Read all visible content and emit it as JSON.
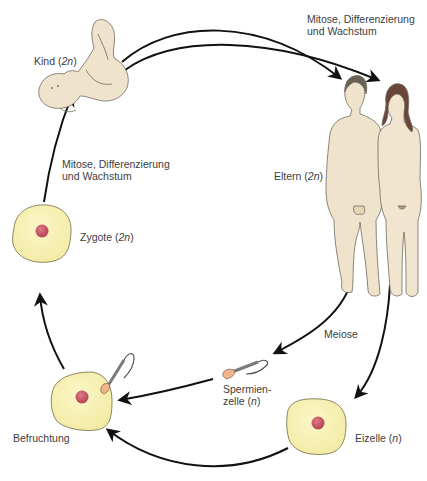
{
  "title_fragment": "",
  "labels": {
    "kind": {
      "name": "Kind",
      "ploidy": "2n"
    },
    "eltern": {
      "name": "Eltern",
      "ploidy": "2n"
    },
    "zygote": {
      "name": "Zygote",
      "ploidy": "2n"
    },
    "spermienzelle": {
      "line1": "Spermien-",
      "line2": "zelle",
      "ploidy": "n"
    },
    "eizelle": {
      "name": "Eizelle",
      "ploidy": "n"
    },
    "befruchtung": "Befruchtung",
    "meiose": "Meiose",
    "mitose_top": {
      "line1": "Mitose, Differenzierung",
      "line2": "und Wachstum"
    },
    "mitose_left": {
      "line1": "Mitose, Differenzierung",
      "line2": "und Wachstum"
    }
  },
  "colors": {
    "cell_fill": "#f8f2b4",
    "cell_stroke": "#8a8660",
    "nucleus": "#c0505e",
    "skin": "#f0e3cc",
    "skin_stroke": "#6f6a5e",
    "hair_male": "#6b6156",
    "hair_female": "#6a4638",
    "arrow": "#111111"
  },
  "cycle": [
    "Kind (2n)",
    "Eltern (2n)",
    "Spermienzelle (n) / Eizelle (n)",
    "Befruchtung",
    "Zygote (2n)",
    "Kind (2n)"
  ]
}
